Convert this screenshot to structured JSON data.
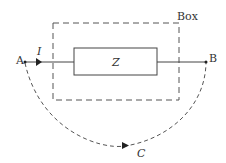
{
  "labels": {
    "box": "Box",
    "z": "Z",
    "a": "A",
    "b": "B",
    "current": "I",
    "contour": "C"
  },
  "colors": {
    "stroke": "#444444",
    "text": "#333333"
  }
}
